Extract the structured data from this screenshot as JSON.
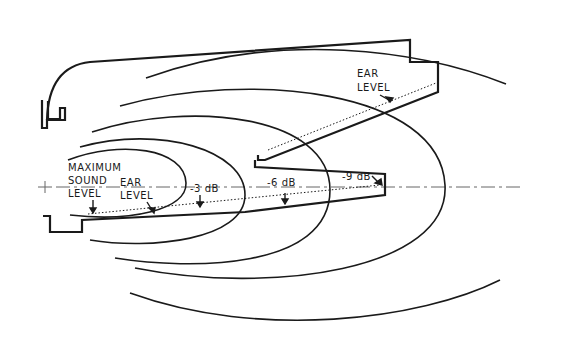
{
  "diagram": {
    "type": "sound-coverage-pattern",
    "labels": {
      "max_sound_line1": "MAXIMUM",
      "max_sound_line2": "SOUND",
      "max_sound_line3": "LEVEL",
      "ear_level_lower_line1": "EAR",
      "ear_level_lower_line2": "LEVEL",
      "ear_level_upper_line1": "EAR",
      "ear_level_upper_line2": "LEVEL",
      "db3": "-3 dB",
      "db6": "-6 dB",
      "db9": "-9 dB"
    },
    "colors": {
      "line": "#1a1a1a",
      "background": "#ffffff",
      "axis": "#555555"
    }
  }
}
